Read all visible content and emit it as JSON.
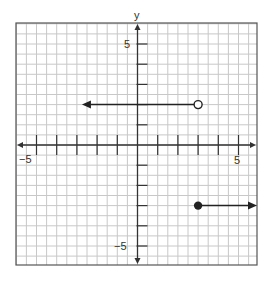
{
  "chart_data": {
    "type": "line",
    "title": "",
    "xlabel": "",
    "ylabel": "y",
    "xlim": [
      -5.5,
      6.0
    ],
    "ylim": [
      -6.0,
      6.0
    ],
    "grid": true,
    "grid_step": 0.5,
    "x_tick_labels": [
      {
        "value": -5,
        "label": "−5"
      },
      {
        "value": 5,
        "label": "5"
      }
    ],
    "y_tick_labels": [
      {
        "value": 5,
        "label": "5"
      },
      {
        "value": -5,
        "label": "−5"
      }
    ],
    "x_ticks": [
      -5,
      -4,
      -3,
      -2,
      -1,
      1,
      2,
      3,
      4,
      5
    ],
    "y_ticks": [
      5,
      4,
      3,
      2,
      1,
      -1,
      -2,
      -3,
      -4,
      -5
    ],
    "series": [
      {
        "name": "left ray",
        "description": "y = 2 for x < 3",
        "y": 2,
        "x_from": 3,
        "endpoint": "open",
        "direction": "left",
        "arrow_tip_x": -2.75
      },
      {
        "name": "right ray",
        "description": "y = -3 for x >= 3",
        "y": -3,
        "x_from": 3,
        "endpoint": "closed",
        "direction": "right",
        "arrow_tip_x": 6.0
      }
    ],
    "colors": {
      "grid": "#c8c8c8",
      "axes": "#333333",
      "series": "#222222",
      "frame": "#555555"
    }
  },
  "labels": {
    "y_axis": "y",
    "x_neg5": "−5",
    "x_pos5": "5",
    "y_pos5": "5",
    "y_neg5": "−5"
  }
}
